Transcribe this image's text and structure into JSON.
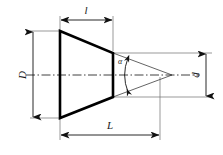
{
  "drawing": {
    "type": "engineering-dimension-diagram",
    "subject": "truncated cone (frustum) longitudinal section with taper angle",
    "background_color": "#ffffff",
    "outline_color": "#000000",
    "thin_line_color": "#555555",
    "centerline_color": "#333333"
  },
  "labels": {
    "small_length": "l",
    "large_diameter": "D",
    "small_diameter": "d",
    "overall_length": "L",
    "taper_angle": "α"
  },
  "dimensions": [
    {
      "name": "small_length",
      "symbol": "l",
      "orientation": "horizontal",
      "position": "top",
      "arrows": "both"
    },
    {
      "name": "large_diameter",
      "symbol": "D",
      "orientation": "vertical",
      "position": "left",
      "arrows": "both"
    },
    {
      "name": "small_diameter",
      "symbol": "d",
      "orientation": "vertical",
      "position": "right",
      "arrows": "both"
    },
    {
      "name": "overall_length",
      "symbol": "L",
      "orientation": "horizontal",
      "position": "bottom",
      "arrows": "both"
    },
    {
      "name": "taper_angle",
      "symbol": "α",
      "orientation": "angular",
      "position": "apex",
      "arrows": "both"
    }
  ],
  "geometry": {
    "frustum": {
      "left_top": [
        60,
        31
      ],
      "left_bottom": [
        60,
        118
      ],
      "right_top": [
        113,
        53
      ],
      "right_bottom": [
        113,
        97
      ]
    },
    "apex": [
      172,
      75
    ],
    "centerline_y": 75
  }
}
